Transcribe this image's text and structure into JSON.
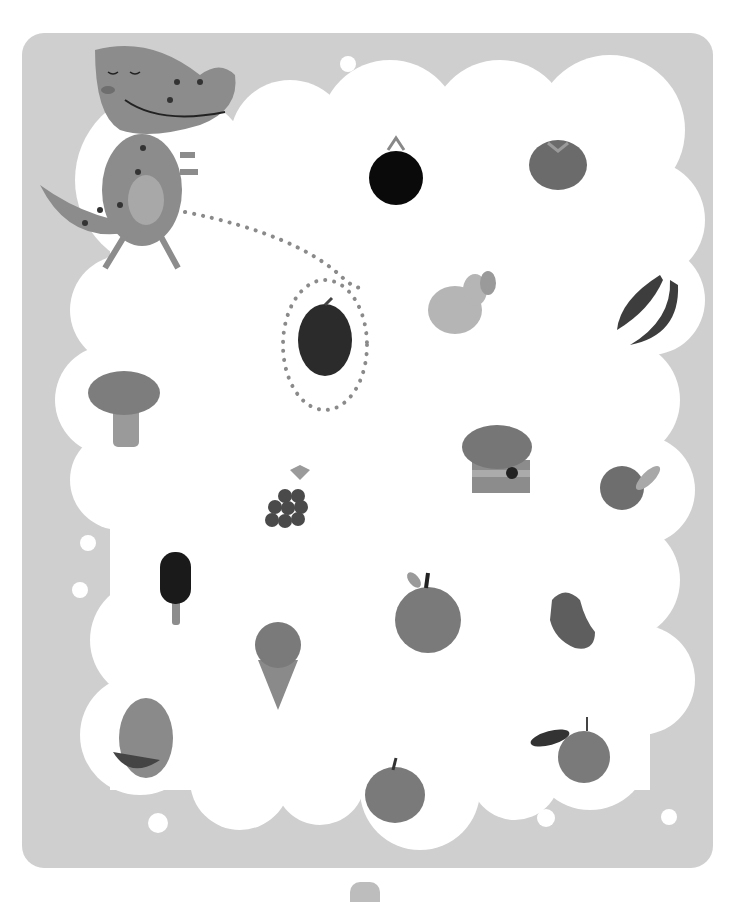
{
  "game": {
    "type": "maze-path-food-matching",
    "character": "dinosaur",
    "path_target": "plum",
    "colors": {
      "panel": "#cfcfcf",
      "cloud": "#ffffff",
      "dots": "#8a8a8a",
      "dino": "#8c8c8c"
    }
  },
  "items": [
    {
      "name": "blackberry",
      "x": 396,
      "y": 175
    },
    {
      "name": "tomato",
      "x": 558,
      "y": 160
    },
    {
      "name": "pear",
      "x": 455,
      "y": 300
    },
    {
      "name": "chili-peppers",
      "x": 652,
      "y": 305
    },
    {
      "name": "plum",
      "x": 325,
      "y": 340
    },
    {
      "name": "broccoli",
      "x": 124,
      "y": 405
    },
    {
      "name": "cupcake",
      "x": 497,
      "y": 460
    },
    {
      "name": "pomegranate",
      "x": 630,
      "y": 488
    },
    {
      "name": "grapes",
      "x": 292,
      "y": 498
    },
    {
      "name": "popsicle",
      "x": 175,
      "y": 585
    },
    {
      "name": "apple",
      "x": 428,
      "y": 612
    },
    {
      "name": "bean",
      "x": 571,
      "y": 620
    },
    {
      "name": "ice-cream-cone",
      "x": 278,
      "y": 662
    },
    {
      "name": "watermelon",
      "x": 143,
      "y": 738
    },
    {
      "name": "pumpkin",
      "x": 395,
      "y": 790
    },
    {
      "name": "orange",
      "x": 581,
      "y": 755
    }
  ]
}
